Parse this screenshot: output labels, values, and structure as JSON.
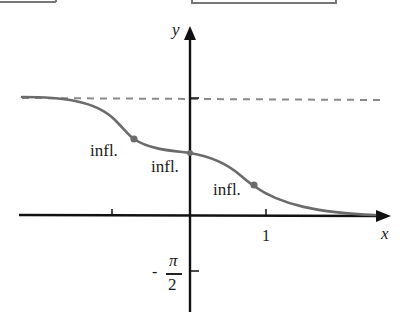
{
  "diagram": {
    "type": "function-graph",
    "axes": {
      "x_label": "x",
      "y_label": "y",
      "x_tick_label": "1",
      "y_tick_label": {
        "sign": "-",
        "numerator": "π",
        "denominator": "2"
      }
    },
    "annotations": {
      "inflection_left": "infl.",
      "inflection_middle": "infl.",
      "inflection_right": "infl."
    },
    "asymptote": "horizontal dashed line (upper)",
    "colors": {
      "axis": "#111111",
      "curve": "#6b6b6b",
      "asymptote": "#8a8a8a",
      "point": "#6b6b6b",
      "frame": "#777777"
    }
  }
}
